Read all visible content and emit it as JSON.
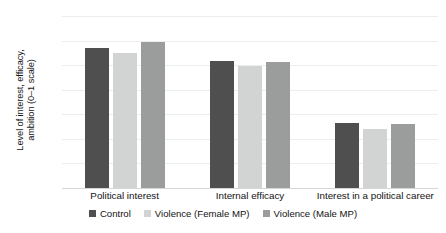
{
  "chart_data": {
    "type": "bar",
    "title": "",
    "xlabel": "",
    "ylabel": "Level of interest, efficacy, ambition (0–1 scale)",
    "ylabel_line1": "Level of interest, efficacy,",
    "ylabel_line2": "ambition (0–1 scale)",
    "categories": [
      "Political interest",
      "Internal efficacy",
      "Interest in a political career"
    ],
    "series": [
      {
        "name": "Control",
        "color": "#4f4f4f",
        "values": [
          0.57,
          0.515,
          0.265
        ]
      },
      {
        "name": "Violence (Female MP)",
        "color": "#d2d3d3",
        "values": [
          0.55,
          0.495,
          0.242
        ]
      },
      {
        "name": "Violence (Male MP)",
        "color": "#9b9c9c",
        "values": [
          0.595,
          0.513,
          0.259
        ]
      }
    ],
    "ylim": [
      0,
      0.7
    ],
    "yticks": [
      "0.7",
      "0.6",
      "0.5",
      "0.4",
      "0.3",
      "0.2",
      "0.1",
      "0"
    ],
    "ytick_values": [
      0.7,
      0.6,
      0.5,
      0.4,
      0.3,
      0.2,
      0.1,
      0
    ],
    "grid": true,
    "legend_position": "bottom",
    "background": "#ffffff"
  }
}
